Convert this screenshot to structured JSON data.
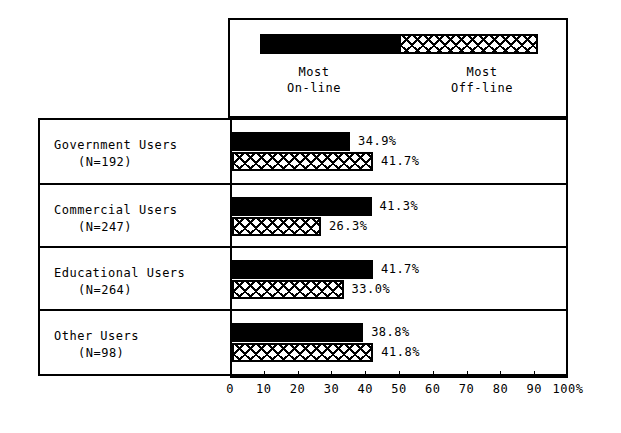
{
  "legend": {
    "left_label_line1": "Most",
    "left_label_line2": "On-line",
    "right_label_line1": "Most",
    "right_label_line2": "Off-line",
    "left_swatch": "solid-black",
    "right_swatch": "crosshatch"
  },
  "axis": {
    "ticks": [
      0,
      10,
      20,
      30,
      40,
      50,
      60,
      70,
      80,
      90,
      100
    ],
    "tick_labels": [
      "0",
      "10",
      "20",
      "30",
      "40",
      "50",
      "60",
      "70",
      "80",
      "90",
      "100%"
    ],
    "min": 0,
    "max": 100
  },
  "rows": [
    {
      "name": "Government Users",
      "n_label": "(N=192)",
      "online_value": 34.9,
      "online_label": "34.9%",
      "offline_value": 41.7,
      "offline_label": "41.7%"
    },
    {
      "name": "Commercial Users",
      "n_label": "(N=247)",
      "online_value": 41.3,
      "online_label": "41.3%",
      "offline_value": 26.3,
      "offline_label": "26.3%"
    },
    {
      "name": "Educational Users",
      "n_label": "(N=264)",
      "online_value": 41.7,
      "online_label": "41.7%",
      "offline_value": 33.0,
      "offline_label": "33.0%"
    },
    {
      "name": "Other Users",
      "n_label": "(N=98)",
      "online_value": 38.8,
      "online_label": "38.8%",
      "offline_value": 41.8,
      "offline_label": "41.8%"
    }
  ],
  "chart_data": {
    "type": "bar",
    "orientation": "horizontal",
    "title": "",
    "xlabel": "",
    "ylabel": "",
    "xlim": [
      0,
      100
    ],
    "grid": false,
    "legend_position": "top",
    "categories": [
      "Government Users (N=192)",
      "Commercial Users (N=247)",
      "Educational Users (N=264)",
      "Other Users (N=98)"
    ],
    "series": [
      {
        "name": "Most On-line",
        "pattern": "solid-black",
        "values": [
          34.9,
          41.3,
          41.7,
          38.8
        ],
        "data_labels": [
          "34.9%",
          "41.3%",
          "41.7%",
          "38.8%"
        ]
      },
      {
        "name": "Most Off-line",
        "pattern": "crosshatch",
        "values": [
          41.7,
          26.3,
          33.0,
          41.8
        ],
        "data_labels": [
          "41.7%",
          "26.3%",
          "33.0%",
          "41.8%"
        ]
      }
    ],
    "sample_sizes": [
      192,
      247,
      264,
      98
    ],
    "axis_ticks": [
      0,
      10,
      20,
      30,
      40,
      50,
      60,
      70,
      80,
      90,
      100
    ],
    "axis_tick_labels": [
      "0",
      "10",
      "20",
      "30",
      "40",
      "50",
      "60",
      "70",
      "80",
      "90",
      "100%"
    ],
    "units": "percent"
  },
  "colors": {
    "ink": "#000000",
    "paper": "#ffffff"
  }
}
